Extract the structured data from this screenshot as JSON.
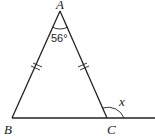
{
  "diagram": {
    "type": "geometry-triangle",
    "vertices": {
      "A": {
        "label": "A",
        "x": 60,
        "y": 11
      },
      "B": {
        "label": "B",
        "x": 12,
        "y": 118
      },
      "C": {
        "label": "C",
        "x": 107,
        "y": 118
      }
    },
    "extension_end": {
      "x": 155,
      "y": 118
    },
    "angle_A": {
      "label": "56°"
    },
    "exterior_angle_C": {
      "label": "x"
    },
    "equal_sides": [
      "AB",
      "AC"
    ],
    "stroke_color": "#222222"
  }
}
